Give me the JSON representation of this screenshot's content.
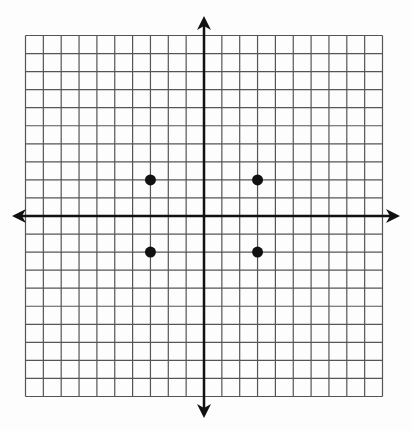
{
  "chart_data": {
    "type": "scatter",
    "title": "",
    "xlabel": "",
    "ylabel": "",
    "xlim": [
      -10,
      10
    ],
    "ylim": [
      -10,
      10
    ],
    "grid": true,
    "grid_step": 1,
    "axes_arrows": true,
    "tick_labels": false,
    "series": [
      {
        "name": "points",
        "points": [
          {
            "x": -3,
            "y": 2
          },
          {
            "x": 3,
            "y": 2
          },
          {
            "x": -3,
            "y": -2
          },
          {
            "x": 3,
            "y": -2
          }
        ]
      }
    ]
  },
  "colors": {
    "background": "#fdfdfd",
    "grid": "#555555",
    "axis": "#111111",
    "point": "#111111"
  }
}
